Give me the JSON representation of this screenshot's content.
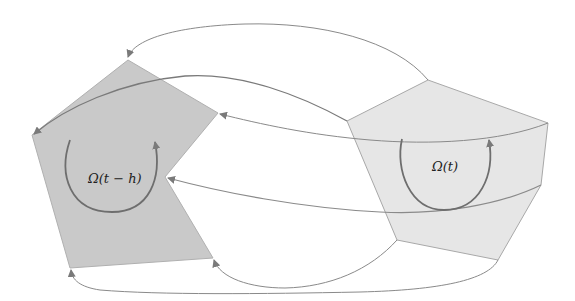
{
  "diagram": {
    "title": "",
    "regions": [
      {
        "id": "omega-t-minus-h",
        "label": "Ω(t − h)",
        "fill": "#c9c9c9",
        "stroke": "#b0b0b0",
        "points": [
          [
            128,
            60
          ],
          [
            218,
            113
          ],
          [
            165,
            177
          ],
          [
            213,
            258
          ],
          [
            70,
            268
          ],
          [
            32,
            135
          ]
        ]
      },
      {
        "id": "omega-t",
        "label": "Ω(t)",
        "fill": "#e6e6e6",
        "stroke": "#a8a8a8",
        "points": [
          [
            428,
            80
          ],
          [
            548,
            123
          ],
          [
            541,
            185
          ],
          [
            498,
            260
          ],
          [
            397,
            240
          ],
          [
            347,
            121
          ]
        ]
      }
    ],
    "mapping_arrows": [
      {
        "from": "Ω(t) top vertex",
        "to": "Ω(t−h) top vertex"
      },
      {
        "from": "Ω(t) left vertex",
        "to": "Ω(t−h) left vertex"
      },
      {
        "from": "Ω(t) right vertex",
        "to": "Ω(t−h) upper-right vertex"
      },
      {
        "from": "Ω(t) lower-right vertex",
        "to": "Ω(t−h) notch vertex"
      },
      {
        "from": "Ω(t) bottom-left vertex",
        "to": "Ω(t−h) bottom-right vertex"
      },
      {
        "from": "Ω(t) bottom-right vertex",
        "to": "Ω(t−h) bottom-left vertex"
      }
    ],
    "orientation_arrows": [
      {
        "region": "Ω(t−h)",
        "direction": "counterclockwise-open-top"
      },
      {
        "region": "Ω(t)",
        "direction": "counterclockwise-open-top"
      }
    ],
    "colors": {
      "line": "#8a8a8a",
      "loop": "#6e6e6e",
      "arrowhead": "#7a7a7a"
    }
  }
}
